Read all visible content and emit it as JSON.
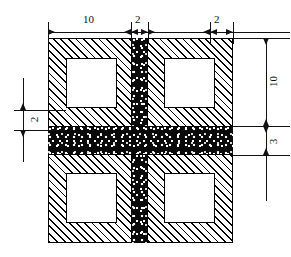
{
  "drawing": {
    "title": "Hatched block with stippled cross-band cross-section",
    "type": "engineering-cross-section",
    "units": "unitless modular units",
    "colors": {
      "line": "#111111",
      "hatch_fill": "#000000",
      "stipple_fill": "#0a0a0a",
      "void_fill": "#ffffff",
      "background": "#ffffff"
    }
  },
  "dimensions": {
    "top": [
      {
        "id": "top-10",
        "label": "10"
      },
      {
        "id": "top-2-left",
        "label": "2"
      },
      {
        "id": "top-2-right",
        "label": "2"
      }
    ],
    "right": [
      {
        "id": "right-10",
        "label": "10"
      },
      {
        "id": "right-3",
        "label": "3"
      }
    ],
    "left": [
      {
        "id": "left-2",
        "label": "2"
      }
    ]
  },
  "geometry": {
    "outer_block": {
      "label": "hatched-outer-block"
    },
    "vertical_band": {
      "label": "stippled-vertical-band",
      "width_units": "2"
    },
    "horizontal_band": {
      "label": "stippled-horizontal-band",
      "height_units": "3"
    },
    "voids": [
      {
        "id": "void-top-left",
        "label": "void-top-left"
      },
      {
        "id": "void-top-right",
        "label": "void-top-right"
      },
      {
        "id": "void-bottom-left",
        "label": "void-bottom-left"
      },
      {
        "id": "void-bottom-right",
        "label": "void-bottom-right"
      }
    ]
  }
}
